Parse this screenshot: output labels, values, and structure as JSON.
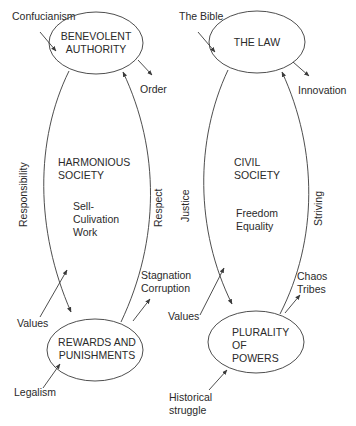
{
  "diagram": {
    "left": {
      "top_node": {
        "lines": [
          "BENEVOLENT",
          "AUTHORITY"
        ]
      },
      "bottom_node": {
        "lines": [
          "REWARDS AND",
          "PUNISHMENTS"
        ]
      },
      "center_title": [
        "HARMONIOUS",
        "SOCIETY"
      ],
      "center_sub": [
        "Sell-",
        "Culivation",
        "Work"
      ],
      "input_top": "Confucianism",
      "output_top": "Order",
      "left_edge_label": "Responsibility",
      "right_edge_label": "Respect",
      "input_mid": "Values",
      "output_bottom": [
        "Stagnation",
        "Corruption"
      ],
      "input_bottom": "Legalism"
    },
    "right": {
      "top_node": {
        "lines": [
          "THE LAW"
        ]
      },
      "bottom_node": {
        "lines": [
          "PLURALITY",
          "OF",
          "POWERS"
        ]
      },
      "center_title": [
        "CIVIL",
        "SOCIETY"
      ],
      "center_sub": [
        "Freedom",
        "Equality"
      ],
      "input_top": "The Bible",
      "output_top": "Innovation",
      "left_edge_label": "Justice",
      "right_edge_label": "Striving",
      "input_mid": "Values",
      "output_bottom": [
        "Chaos",
        "Tribes"
      ],
      "input_bottom": [
        "Historical",
        "struggle"
      ]
    }
  }
}
